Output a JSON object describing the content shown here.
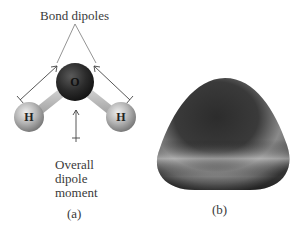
{
  "panel_a": {
    "title_label": "Bond dipoles",
    "overall_label_lines": [
      "Overall",
      "dipole",
      "moment"
    ],
    "caption": "(a)",
    "atoms": {
      "oxygen": "O",
      "hydrogen_left": "H",
      "hydrogen_right": "H"
    }
  },
  "panel_b": {
    "caption": "(b)"
  },
  "colors": {
    "oxygen": "#2a2a2a",
    "hydrogen": "#b8b8b8",
    "bond": "#c8c8c8",
    "arrow": "#444444"
  }
}
